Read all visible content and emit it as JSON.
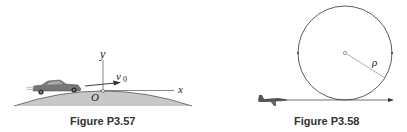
{
  "figures": [
    {
      "caption": "Figure P3.57",
      "labels": {
        "y_axis": "y",
        "x_axis": "x",
        "origin": "O",
        "velocity": "v",
        "velocity_sub": "0"
      },
      "colors": {
        "hill_fill": "#c8c8c8",
        "hill_edge": "#555555",
        "axis": "#444444"
      }
    },
    {
      "caption": "Figure P3.58",
      "labels": {
        "radius": "ρ"
      },
      "colors": {
        "circle": "#333333",
        "radius_line": "#666666"
      }
    }
  ]
}
